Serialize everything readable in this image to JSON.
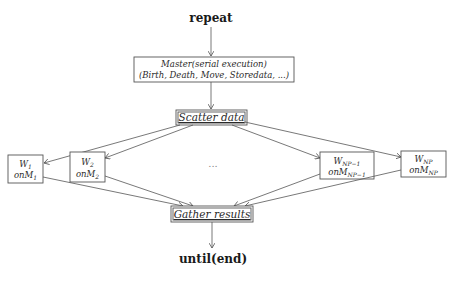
{
  "diagram": {
    "top_label": "repeat",
    "bottom_label": "until(end)",
    "master": {
      "line1": "Master(serial execution)",
      "line2": "(Birth, Death, Move, Storedata, ...)"
    },
    "scatter": {
      "label": "Scatter data"
    },
    "gather": {
      "label": "Gather results"
    },
    "ellipsis": "...",
    "workers": [
      {
        "w": "W",
        "w_sub": "1",
        "m": "onM",
        "m_sub": "1"
      },
      {
        "w": "W",
        "w_sub": "2",
        "m": "onM",
        "m_sub": "2"
      },
      {
        "w": "W",
        "w_sub": "NP−1",
        "m": "onM",
        "m_sub": "NP−1"
      },
      {
        "w": "W",
        "w_sub": "NP",
        "m": "onM",
        "m_sub": "NP"
      }
    ]
  },
  "colors": {
    "stroke": "#555555",
    "text": "#1a1a1a",
    "background": "#ffffff"
  }
}
